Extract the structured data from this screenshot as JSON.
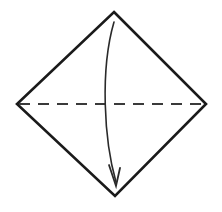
{
  "figure": {
    "caption": "",
    "background_color": "#ffffff",
    "ink_color": "#1a1a1a",
    "width": 222,
    "height": 212,
    "shapes": {
      "diamond": {
        "name": "square-rotated-45",
        "stroke_color": "#1a1a1a",
        "stroke_width": 2.6,
        "fill": "none",
        "line_style": "solid",
        "vertices": [
          {
            "label": "top",
            "x": 114,
            "y": 12
          },
          {
            "label": "right",
            "x": 206,
            "y": 104
          },
          {
            "label": "bottom",
            "x": 115,
            "y": 196
          },
          {
            "label": "left",
            "x": 17,
            "y": 104
          }
        ]
      },
      "dashed_diagonal": {
        "name": "horizontal-diagonal-dashed",
        "stroke_color": "#3a3a3a",
        "stroke_width": 2.2,
        "line_style": "dashed",
        "dash_length": 11,
        "gap_length": 8,
        "start": {
          "x": 19,
          "y": 104
        },
        "end": {
          "x": 204,
          "y": 104
        }
      },
      "fold_arrow": {
        "name": "curved-fold-arrow",
        "stroke_color": "#2a2a2a",
        "stroke_width": 1.6,
        "line_style": "solid",
        "start": {
          "x": 114,
          "y": 22
        },
        "end": {
          "x": 116,
          "y": 182
        },
        "control_1": {
          "x": 100,
          "y": 70
        },
        "control_2": {
          "x": 104,
          "y": 140
        },
        "arrowhead": {
          "name": "arrowhead-down",
          "tip": {
            "x": 116,
            "y": 186
          },
          "left_barb": {
            "x": 109,
            "y": 165
          },
          "right_barb": {
            "x": 120,
            "y": 168
          },
          "width": 11,
          "height": 21
        }
      }
    }
  }
}
